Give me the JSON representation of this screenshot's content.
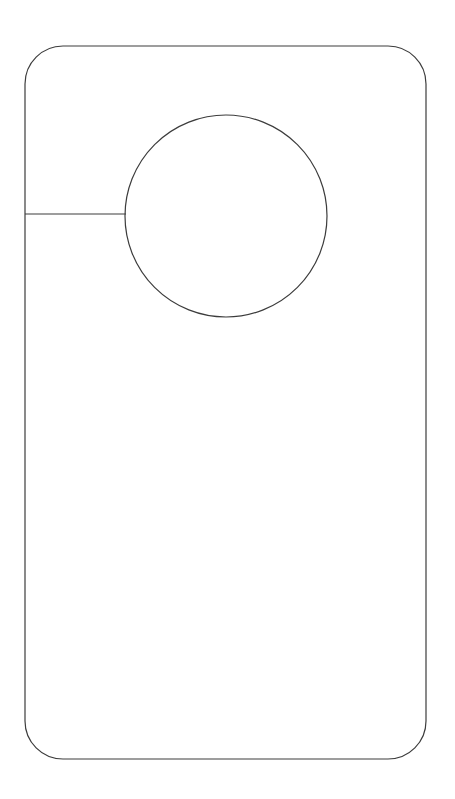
{
  "document": {
    "kind": "door-hanger-die-cut-template",
    "title": "Door Hanger Template",
    "width": 455,
    "height": 799,
    "background_color": "#ffffff",
    "visible_text": []
  },
  "style": {
    "stroke_color": "#3c3c3c",
    "stroke_width": 1.2,
    "fill_color": "#ffffff",
    "background_color": "#ffffff"
  },
  "shapes": {
    "outline": {
      "name": "hanger-body-outline",
      "type": "rounded-rectangle",
      "x": 25,
      "y": 46,
      "width": 401,
      "height": 713,
      "corner_radius": 38,
      "stroke_color": "#3c3c3c",
      "stroke_width": 1.2,
      "fill_color": "#ffffff"
    },
    "knob_hole": {
      "name": "door-knob-hole",
      "type": "circle",
      "center_x": 226,
      "center_y": 216,
      "radius": 101,
      "stroke_color": "#3c3c3c",
      "stroke_width": 1.2,
      "fill_color": "#ffffff"
    },
    "slit": {
      "name": "knob-slot-slit",
      "type": "line",
      "x1": 25,
      "y1": 214,
      "x2": 126,
      "y2": 214,
      "stroke_color": "#3c3c3c",
      "stroke_width": 1.2
    }
  }
}
